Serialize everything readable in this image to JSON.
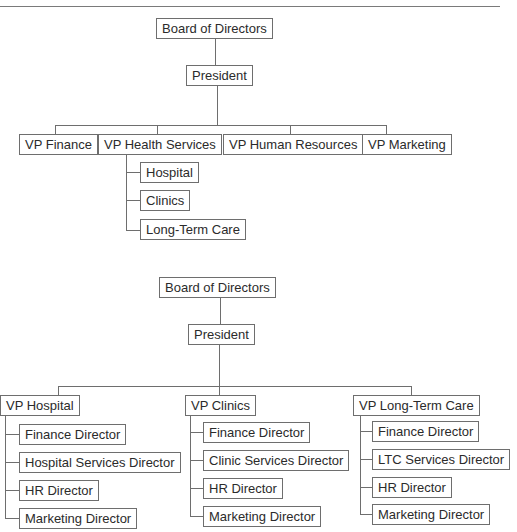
{
  "chart1": {
    "board": "Board of Directors",
    "president": "President",
    "vps": [
      "VP Finance",
      "VP Health Services",
      "VP Human Resources",
      "VP Marketing"
    ],
    "health_services_units": [
      "Hospital",
      "Clinics",
      "Long-Term Care"
    ]
  },
  "chart2": {
    "board": "Board of Directors",
    "president": "President",
    "vps": [
      {
        "title": "VP Hospital",
        "directors": [
          "Finance Director",
          "Hospital Services Director",
          "HR Director",
          "Marketing Director"
        ]
      },
      {
        "title": "VP Clinics",
        "directors": [
          "Finance Director",
          "Clinic Services Director",
          "HR Director",
          "Marketing Director"
        ]
      },
      {
        "title": "VP Long-Term Care",
        "directors": [
          "Finance Director",
          "LTC Services Director",
          "HR Director",
          "Marketing Director"
        ]
      }
    ]
  },
  "colors": {
    "line": "#6e6e6e",
    "text": "#2b2b2b",
    "background": "#ffffff"
  }
}
